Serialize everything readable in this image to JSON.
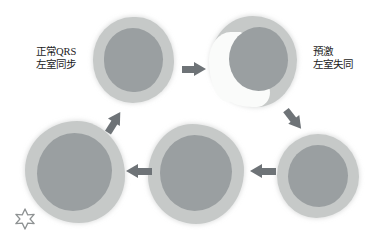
{
  "diagram": {
    "background_color": "#ffffff",
    "ring_color": "#c6c9c8",
    "cavity_color": "#9a9fa1",
    "wedge_color": "#fafbfa",
    "arrow_color": "#6e7377"
  },
  "labels": {
    "left": {
      "line1": "正常QRS",
      "line2": "左室同步"
    },
    "right": {
      "line1": "預激",
      "line2": "左室失同"
    }
  },
  "panels": [
    {
      "id": "panel-1",
      "position": "top-left",
      "caption": "正常QRS 左室同步",
      "has_wedge": false
    },
    {
      "id": "panel-2",
      "position": "top-right",
      "caption": "預激 左室失同",
      "has_wedge": true
    },
    {
      "id": "panel-3",
      "position": "middle-right",
      "caption": "",
      "has_wedge": false
    },
    {
      "id": "panel-4",
      "position": "bottom-center",
      "caption": "",
      "has_wedge": false
    },
    {
      "id": "panel-5",
      "position": "bottom-left",
      "caption": "",
      "has_wedge": false
    }
  ],
  "arrows": [
    {
      "id": "arrow-1",
      "from": "panel-1",
      "to": "panel-2",
      "direction": "right"
    },
    {
      "id": "arrow-2",
      "from": "panel-2",
      "to": "panel-3",
      "direction": "down-right"
    },
    {
      "id": "arrow-3",
      "from": "panel-3",
      "to": "panel-4",
      "direction": "left"
    },
    {
      "id": "arrow-4",
      "from": "panel-4",
      "to": "panel-5",
      "direction": "left"
    },
    {
      "id": "arrow-5",
      "from": "panel-5",
      "to": "panel-1",
      "direction": "up-right"
    }
  ],
  "marker": {
    "name": "star-marker",
    "shape": "six-point-star-outline",
    "color": "#8e9293"
  }
}
